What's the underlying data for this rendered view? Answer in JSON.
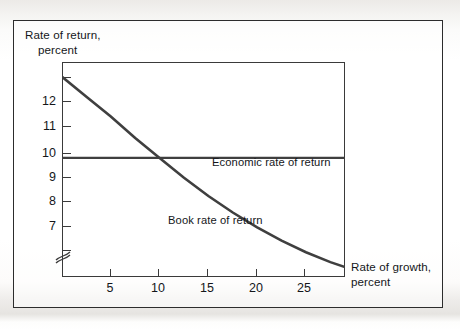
{
  "figure": {
    "background_color": "#f2f1ef",
    "frame_color": "#2c2c2c",
    "plot_background": "#ffffff"
  },
  "axes": {
    "y_title_line1": "Rate of return,",
    "y_title_line2": "percent",
    "x_title_line1": "Rate of growth,",
    "x_title_line2": "percent",
    "y_ticks": [
      "12",
      "11",
      "10",
      "9",
      "8",
      "7"
    ],
    "x_ticks": [
      "5",
      "10",
      "15",
      "20",
      "25"
    ],
    "y_axis_break": "axis-break-symbol"
  },
  "labels": {
    "economic": "Economic rate of return",
    "book": "Book rate of return"
  },
  "chart_data": {
    "type": "line",
    "title": "",
    "xlabel": "Rate of growth, percent",
    "ylabel": "Rate of return, percent",
    "xlim": [
      0,
      29
    ],
    "ylim": [
      6.4,
      12.9
    ],
    "xticks": [
      5,
      10,
      15,
      20,
      25
    ],
    "yticks": [
      7,
      8,
      9,
      10,
      11,
      12
    ],
    "grid": false,
    "legend": "inline-annotations",
    "line_color": "#3f3f3f",
    "series": [
      {
        "name": "Economic rate of return",
        "type": "line",
        "style": "horizontal-constant",
        "constant_value": 10,
        "x": [
          0,
          5,
          10,
          15,
          20,
          25,
          29
        ],
        "values": [
          10,
          10,
          10,
          10,
          10,
          10,
          10
        ]
      },
      {
        "name": "Book rate of return",
        "type": "line",
        "style": "convex-decreasing",
        "x": [
          0,
          2.5,
          5,
          7.5,
          10,
          12.5,
          15,
          17.5,
          20,
          22.5,
          25,
          27.5,
          29
        ],
        "values": [
          12.45,
          11.85,
          11.25,
          10.6,
          10.0,
          9.4,
          8.85,
          8.35,
          7.9,
          7.5,
          7.15,
          6.85,
          6.7
        ]
      }
    ],
    "annotations": [
      {
        "text": "Economic rate of return",
        "x": 15.5,
        "y": 9.6
      },
      {
        "text": "Book rate of return",
        "x": 11.0,
        "y": 7.25
      }
    ],
    "crossing_point": {
      "x": 10,
      "y": 10
    }
  }
}
